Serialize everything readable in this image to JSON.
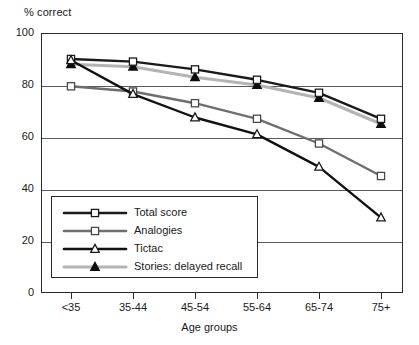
{
  "chart_data": {
    "type": "line",
    "title": "",
    "xlabel": "Age groups",
    "ylabel": "% correct",
    "categories": [
      "<35",
      "35-44",
      "45-54",
      "55-64",
      "65-74",
      "75+"
    ],
    "ylim": [
      0,
      100
    ],
    "yticks": [
      0,
      20,
      40,
      60,
      80,
      100
    ],
    "grid": "horizontal",
    "legend_position": "inside lower-left",
    "series": [
      {
        "name": "Total score",
        "values": [
          90,
          89,
          86,
          82,
          77,
          67
        ],
        "line_color": "#1a1a1a",
        "marker": "open-square",
        "marker_fill": "#ffffff",
        "marker_edge": "#1a1a1a"
      },
      {
        "name": "Analogies",
        "values": [
          79.5,
          77.5,
          73,
          67,
          57.5,
          45
        ],
        "line_color": "#6e6e6e",
        "marker": "open-square",
        "marker_fill": "#ffffff",
        "marker_edge": "#4a4a4a"
      },
      {
        "name": "Tictac",
        "values": [
          89.5,
          76.5,
          67.5,
          61,
          48.5,
          29
        ],
        "line_color": "#111111",
        "marker": "open-triangle",
        "marker_fill": "#ffffff",
        "marker_edge": "#1a1a1a"
      },
      {
        "name": "Stories: delayed recall",
        "values": [
          88,
          87,
          83,
          80,
          75,
          65
        ],
        "line_color": "#b4b4b4",
        "marker": "filled-triangle",
        "marker_fill": "#0d0d0d",
        "marker_edge": "#0d0d0d"
      }
    ]
  },
  "axes": {
    "ylabel_text": "% correct",
    "xlabel_text": "Age groups",
    "ytick_labels": [
      "0",
      "20",
      "40",
      "60",
      "80",
      "100"
    ],
    "xtick_labels": [
      "<35",
      "35-44",
      "45-54",
      "55-64",
      "65-74",
      "75+"
    ]
  },
  "legend": {
    "items": [
      {
        "label": "Total score"
      },
      {
        "label": "Analogies"
      },
      {
        "label": "Tictac"
      },
      {
        "label": "Stories: delayed recall"
      }
    ]
  }
}
